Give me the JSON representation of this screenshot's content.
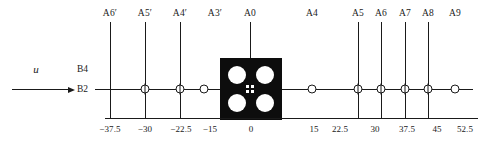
{
  "figure": {
    "flow": {
      "symbol": "u",
      "arrow_name": "flow-direction-arrow"
    },
    "levels": [
      {
        "id": "B4",
        "label": "B4"
      },
      {
        "id": "B2",
        "label": "B2"
      }
    ],
    "stations": [
      {
        "label": "A6′",
        "x": -37.5,
        "has_stem": true,
        "marker": "none"
      },
      {
        "label": "A5′",
        "x": -30,
        "has_stem": true,
        "marker": "crossed"
      },
      {
        "label": "A4′",
        "x": -22.5,
        "has_stem": true,
        "marker": "crossed"
      },
      {
        "label": "A3′",
        "x": -15,
        "has_stem": false,
        "marker": "plain"
      },
      {
        "label": "A0",
        "x": 0,
        "has_stem": true,
        "marker": "block-center"
      },
      {
        "label": "A4",
        "x": 15,
        "has_stem": false,
        "marker": "plain"
      },
      {
        "label": "A5",
        "x": 22.5,
        "has_stem": true,
        "marker": "crossed"
      },
      {
        "label": "A6",
        "x": 30,
        "has_stem": true,
        "marker": "crossed"
      },
      {
        "label": "A7",
        "x": 37.5,
        "has_stem": true,
        "marker": "crossed"
      },
      {
        "label": "A8",
        "x": 45,
        "has_stem": true,
        "marker": "crossed"
      },
      {
        "label": "A9",
        "x": 52.5,
        "has_stem": false,
        "marker": "plain"
      }
    ],
    "scale_ticks": [
      {
        "label": "−37.5",
        "x": -37.5,
        "tick": true
      },
      {
        "label": "−30",
        "x": -30,
        "tick": true
      },
      {
        "label": "−22.5",
        "x": -22.5,
        "tick": true
      },
      {
        "label": "−15",
        "x": -15,
        "tick": false
      },
      {
        "label": "0",
        "x": 0,
        "tick": false
      },
      {
        "label": "15",
        "x": 15,
        "tick": false
      },
      {
        "label": "22.5",
        "x": 22.5,
        "tick": true
      },
      {
        "label": "30",
        "x": 30,
        "tick": true
      },
      {
        "label": "37.5",
        "x": 37.5,
        "tick": true
      },
      {
        "label": "45",
        "x": 45,
        "tick": true
      },
      {
        "label": "52.5",
        "x": 52.5,
        "tick": false
      }
    ],
    "block": {
      "name": "perforated-block",
      "holes": 4,
      "center_marker": "quartered-square"
    },
    "colors": {
      "ink": "#1a1a1a",
      "block_fill": "#0d0d0d",
      "background": "#ffffff",
      "hole_fill": "#ffffff"
    }
  }
}
